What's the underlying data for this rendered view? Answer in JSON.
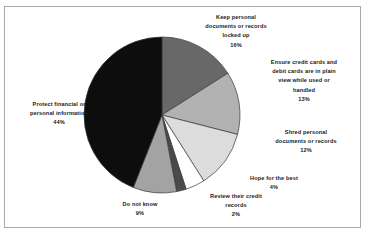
{
  "chart_data": {
    "type": "pie",
    "title": "",
    "subtitle": "",
    "xlabel": "",
    "ylabel": "",
    "legend_position": "none",
    "grid": false,
    "labels_outside": true,
    "start_angle_deg": 0,
    "direction": "clockwise",
    "categories": [
      "Keep personal documents or records locked up",
      "Ensure credit cards and debit cards are in plain view while used or handled",
      "Shred personal documents or records",
      "Hope for the best",
      "Review their credit records",
      "Do not know",
      "Protect financial or personal information"
    ],
    "values": [
      16,
      13,
      12,
      4,
      2,
      9,
      44
    ],
    "value_labels": [
      "16%",
      "13%",
      "12%",
      "4%",
      "2%",
      "9%",
      "44%"
    ],
    "colors": [
      "#686868",
      "#b2b2b2",
      "#dcdcdc",
      "#ffffff",
      "#4a4a4a",
      "#a3a3a3",
      "#0d0d0d"
    ],
    "slice_border_color": "#3a3a3a",
    "units": "percent",
    "total": 100
  },
  "slices": [
    {
      "key": "keep",
      "name": "Keep personal documents or records locked up",
      "line1": "Keep personal",
      "line2": "documents or records",
      "line3": "locked up",
      "pct": "16%",
      "value": 16,
      "color": "#686868"
    },
    {
      "key": "ensure",
      "name": "Ensure credit cards and debit cards are in plain view while used or handled",
      "line1": "Ensure credit cards and",
      "line2": "debit cards are in plain",
      "line3": "view while used or",
      "line4": "handled",
      "pct": "13%",
      "value": 13,
      "color": "#b2b2b2"
    },
    {
      "key": "shred",
      "name": "Shred personal documents or records",
      "line1": "Shred personal",
      "line2": "documents or records",
      "pct": "12%",
      "value": 12,
      "color": "#dcdcdc"
    },
    {
      "key": "hope",
      "name": "Hope for the best",
      "line1": "Hope for the best",
      "pct": "4%",
      "value": 4,
      "color": "#ffffff"
    },
    {
      "key": "review",
      "name": "Review their credit records",
      "line1": "Review their credit",
      "line2": "records",
      "pct": "2%",
      "value": 2,
      "color": "#4a4a4a"
    },
    {
      "key": "donotknow",
      "name": "Do not know",
      "line1": "Do not know",
      "pct": "9%",
      "value": 9,
      "color": "#a3a3a3"
    },
    {
      "key": "protect",
      "name": "Protect financial or personal information",
      "line1": "Protect financial or",
      "line2": "personal information",
      "pct": "44%",
      "value": 44,
      "color": "#0d0d0d"
    }
  ],
  "geometry": {
    "cx": 162,
    "cy": 115,
    "r": 78
  }
}
